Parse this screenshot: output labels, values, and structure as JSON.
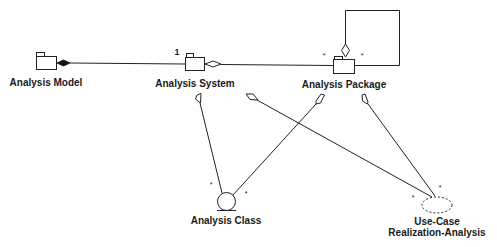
{
  "diagram": {
    "type": "UML class/package diagram",
    "nodes": [
      {
        "id": "analysis-model",
        "label": "Analysis Model",
        "kind": "package"
      },
      {
        "id": "analysis-system",
        "label": "Analysis System",
        "kind": "package"
      },
      {
        "id": "analysis-package",
        "label": "Analysis Package",
        "kind": "package"
      },
      {
        "id": "analysis-class",
        "label": "Analysis Class",
        "kind": "entity-class"
      },
      {
        "id": "use-case-realization",
        "label_line1": "Use-Case",
        "label_line2": "Realization-Analysis",
        "kind": "use-case-realization"
      }
    ],
    "edges": [
      {
        "from": "analysis-model",
        "to": "analysis-system",
        "kind": "composition",
        "target_multiplicity": "1"
      },
      {
        "from": "analysis-system",
        "to": "analysis-package",
        "kind": "aggregation",
        "target_multiplicity": "*"
      },
      {
        "from": "analysis-package",
        "to": "analysis-package",
        "kind": "aggregation",
        "source_multiplicity": "*",
        "note": "self-loop"
      },
      {
        "from": "analysis-system",
        "to": "analysis-class",
        "kind": "aggregation",
        "target_multiplicity": "*"
      },
      {
        "from": "analysis-system",
        "to": "use-case-realization",
        "kind": "aggregation",
        "target_multiplicity": "*"
      },
      {
        "from": "analysis-package",
        "to": "analysis-class",
        "kind": "aggregation",
        "target_multiplicity": "*"
      },
      {
        "from": "analysis-package",
        "to": "use-case-realization",
        "kind": "aggregation",
        "target_multiplicity": "*"
      }
    ],
    "multiplicities": {
      "model_system": "1",
      "system_package": "*",
      "package_self": "*",
      "class_left": "*",
      "class_right": "*",
      "ucr_left": "*",
      "ucr_top": "*"
    }
  }
}
